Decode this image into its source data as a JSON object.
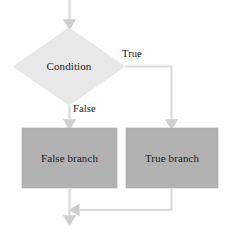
{
  "diagram": {
    "type": "flowchart",
    "nodes": [
      {
        "id": "condition",
        "shape": "diamond",
        "label": "Condition",
        "fill": "#e8e8e8"
      },
      {
        "id": "false-branch",
        "shape": "rectangle",
        "label": "False branch",
        "fill": "#b2b2b2"
      },
      {
        "id": "true-branch",
        "shape": "rectangle",
        "label": "True branch",
        "fill": "#b2b2b2"
      }
    ],
    "edges": [
      {
        "id": "entry",
        "label": "",
        "from": "start",
        "to": "condition"
      },
      {
        "id": "condition-true",
        "label": "True",
        "from": "condition",
        "to": "true-branch"
      },
      {
        "id": "condition-false",
        "label": "False",
        "from": "condition",
        "to": "false-branch"
      },
      {
        "id": "false-merge",
        "label": "",
        "from": "false-branch",
        "to": "merge"
      },
      {
        "id": "true-merge",
        "label": "",
        "from": "true-branch",
        "to": "merge"
      },
      {
        "id": "exit",
        "label": "",
        "from": "merge",
        "to": "end"
      }
    ],
    "colors": {
      "decision_fill": "#e8e8e8",
      "process_fill": "#b2b2b2",
      "arrow": "#d0d0d0",
      "text": "#1a1a1a",
      "background": "#ffffff"
    }
  }
}
